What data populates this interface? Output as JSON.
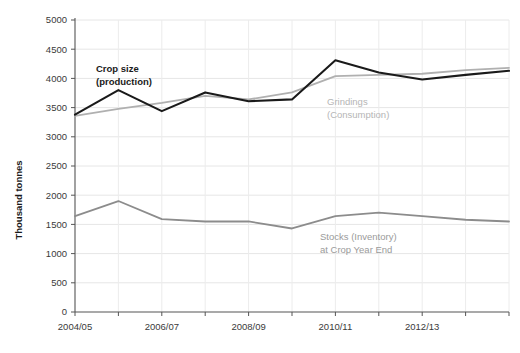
{
  "chart_data": {
    "type": "line",
    "title": "",
    "xlabel": "",
    "ylabel": "Thousand tonnes",
    "ylim": [
      0,
      5000
    ],
    "ytick_step": 500,
    "grid": true,
    "legend": "inline-annotations",
    "x": [
      "2004/05",
      "2005/06",
      "2006/07",
      "2007/08",
      "2008/09",
      "2009/10",
      "2010/11",
      "2011/12",
      "2012/13",
      "2013/14",
      "2014/15"
    ],
    "xtick_labels": [
      "2004/05",
      "",
      "2006/07",
      "",
      "2008/09",
      "",
      "2010/11",
      "",
      "2012/13",
      "",
      ""
    ],
    "yticks": [
      "0",
      "500",
      "1000",
      "1500",
      "2000",
      "2500",
      "3000",
      "3500",
      "4000",
      "4500",
      "5000"
    ],
    "series": [
      {
        "name": "Crop size (production)",
        "color": "#1a1a1a",
        "values": [
          3380,
          3800,
          3440,
          3760,
          3610,
          3640,
          4310,
          4100,
          3980,
          4060,
          4130
        ]
      },
      {
        "name": "Grindings (Consumption)",
        "color": "#b0b0b0",
        "values": [
          3360,
          3480,
          3580,
          3700,
          3640,
          3760,
          4040,
          4060,
          4080,
          4140,
          4180
        ]
      },
      {
        "name": "Stocks (Inventory) at Crop Year End",
        "color": "#8c8c8c",
        "values": [
          1640,
          1900,
          1590,
          1550,
          1550,
          1430,
          1640,
          1700,
          1640,
          1580,
          1550
        ]
      }
    ],
    "annotations": [
      {
        "id": "crop-size-label",
        "line1": "Crop size",
        "line2": "(production)",
        "color": "#1a1a1a",
        "bold": true,
        "x": 96,
        "y": 72
      },
      {
        "id": "grindings-label",
        "line1": "Grindings",
        "line2": "(Consumption)",
        "color": "#b5b5b5",
        "bold": false,
        "x": 327,
        "y": 105
      },
      {
        "id": "stocks-label",
        "line1": "Stocks (Inventory)",
        "line2": "at Crop Year End",
        "color": "#9a9a9a",
        "bold": false,
        "x": 320,
        "y": 240
      }
    ]
  },
  "axis": {
    "y_title": "Thousand tonnes"
  }
}
